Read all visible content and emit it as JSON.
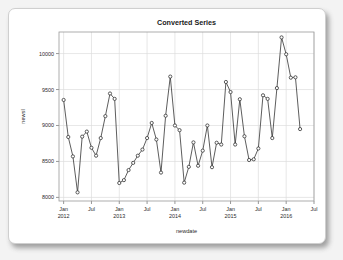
{
  "card": {
    "background": "#ffffff",
    "border_color": "#cfcfcf"
  },
  "chart_data": {
    "type": "line",
    "title": "Converted Series",
    "xlabel": "newdate",
    "ylabel": "newsl",
    "grid": true,
    "legend": null,
    "marker": "open-circle",
    "line_color": "#333333",
    "marker_fill": "#ffffff",
    "ylim": [
      7950,
      10300
    ],
    "yticks": [
      8000,
      8500,
      9000,
      9500,
      10000
    ],
    "ytick_labels": [
      "8000",
      "8500",
      "9000",
      "9500",
      "10000"
    ],
    "xticks": [
      "2012-01",
      "2012-07",
      "2013-01",
      "2013-07",
      "2014-01",
      "2014-07",
      "2015-01",
      "2015-07",
      "2016-01",
      "2016-07"
    ],
    "xtick_labels": [
      {
        "line1": "Jan",
        "line2": "2012"
      },
      {
        "line1": "Jul",
        "line2": ""
      },
      {
        "line1": "Jan",
        "line2": "2013"
      },
      {
        "line1": "Jul",
        "line2": ""
      },
      {
        "line1": "Jan",
        "line2": "2014"
      },
      {
        "line1": "Jul",
        "line2": ""
      },
      {
        "line1": "Jan",
        "line2": "2015"
      },
      {
        "line1": "Jul",
        "line2": ""
      },
      {
        "line1": "Jan",
        "line2": "2016"
      },
      {
        "line1": "Jul",
        "line2": ""
      }
    ],
    "xlim": [
      "2011-12",
      "2016-07"
    ],
    "x": [
      "2012-01",
      "2012-02",
      "2012-03",
      "2012-04",
      "2012-05",
      "2012-06",
      "2012-07",
      "2012-08",
      "2012-09",
      "2012-10",
      "2012-11",
      "2012-12",
      "2013-01",
      "2013-02",
      "2013-03",
      "2013-04",
      "2013-05",
      "2013-06",
      "2013-07",
      "2013-08",
      "2013-09",
      "2013-10",
      "2013-11",
      "2013-12",
      "2014-01",
      "2014-02",
      "2014-03",
      "2014-04",
      "2014-05",
      "2014-06",
      "2014-07",
      "2014-08",
      "2014-09",
      "2014-10",
      "2014-11",
      "2014-12",
      "2015-01",
      "2015-02",
      "2015-03",
      "2015-04",
      "2015-05",
      "2015-06",
      "2015-07",
      "2015-08",
      "2015-09",
      "2015-10",
      "2015-11",
      "2015-12",
      "2016-01",
      "2016-02",
      "2016-03",
      "2016-04"
    ],
    "values": [
      9355,
      8840,
      8570,
      8070,
      8845,
      8915,
      8690,
      8580,
      8825,
      9130,
      9445,
      9370,
      8200,
      8240,
      8380,
      8480,
      8580,
      8665,
      8825,
      9035,
      8805,
      8345,
      9135,
      9680,
      9000,
      8935,
      8205,
      8425,
      8765,
      8440,
      8650,
      9000,
      8420,
      8760,
      8735,
      9605,
      9465,
      8735,
      9365,
      8850,
      8520,
      8530,
      8680,
      9420,
      9370,
      8825,
      9520,
      10225,
      9990,
      9665,
      9670,
      8950
    ],
    "series_name": "newsl"
  }
}
